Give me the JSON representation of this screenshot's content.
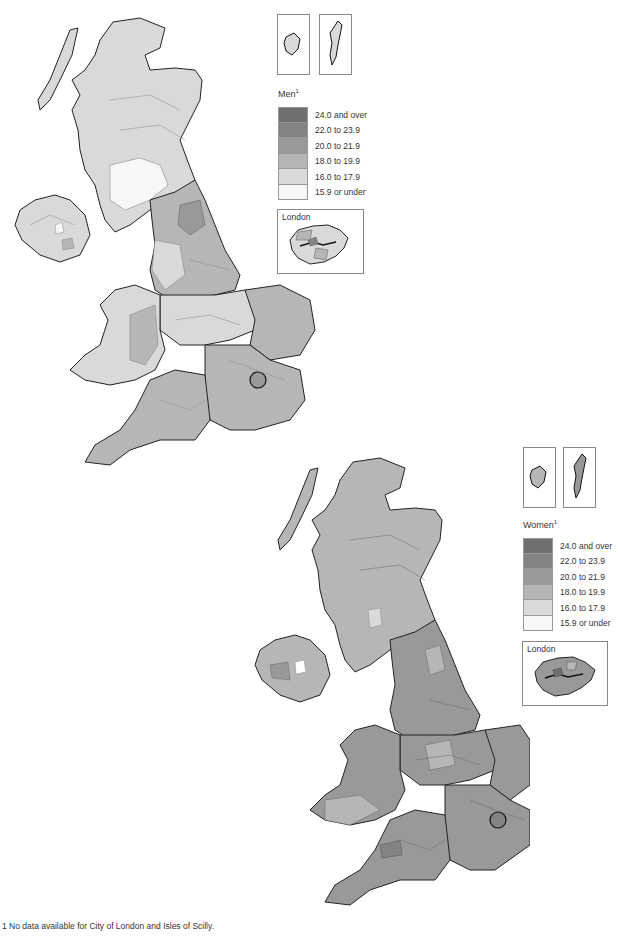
{
  "maps": [
    {
      "id": "men",
      "title": "Men",
      "title_superscript": "1",
      "dominant_shade_index": 4,
      "inset_label": "London"
    },
    {
      "id": "women",
      "title": "Women",
      "title_superscript": "1",
      "dominant_shade_index": 2,
      "inset_label": "London"
    }
  ],
  "legend": {
    "classes": [
      {
        "label": "24.0 and over",
        "color": "#6f6f6f"
      },
      {
        "label": "22.0 to 23.9",
        "color": "#838383"
      },
      {
        "label": "20.0 to 21.9",
        "color": "#999999"
      },
      {
        "label": "18.0 to 19.9",
        "color": "#b6b6b6"
      },
      {
        "label": "16.0 to 17.9",
        "color": "#d9d9d9"
      },
      {
        "label": "15.9 or under",
        "color": "#f7f7f7"
      }
    ]
  },
  "footnote": "1 No data available for City of London and Isles of Scilly."
}
